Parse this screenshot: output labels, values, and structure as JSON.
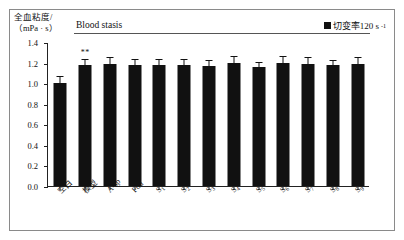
{
  "figure": {
    "y_axis_title_line1": "全血粘度/",
    "y_axis_title_line2": "（mPa · s）",
    "group_header": "Blood stasis",
    "legend": {
      "label_main": "切变率120 s",
      "label_sup": "-1",
      "swatch_color": "#111111"
    },
    "significance_marker": "**"
  },
  "chart_data": {
    "type": "bar",
    "title": "",
    "subtitle": "Blood stasis",
    "xlabel": "",
    "ylabel": "全血粘度/（mPa · s）",
    "ylim": [
      0.0,
      1.4
    ],
    "ytick_labels": [
      "0.0",
      "0.2",
      "0.4",
      "0.6",
      "0.8",
      "1.0",
      "1.2",
      "1.4"
    ],
    "ytick_values": [
      0.0,
      0.2,
      0.4,
      0.6,
      0.8,
      1.0,
      1.2,
      1.4
    ],
    "grid": false,
    "legend_position": "top-right",
    "legend_entries": [
      "切变率120 s-1"
    ],
    "bar_color": "#111111",
    "categories": [
      "空白",
      "模型",
      "A-sp",
      "Fdd",
      "S₁",
      "S₂",
      "S₃",
      "S₄",
      "S₅",
      "S₆",
      "S₇",
      "S₈",
      "S₉"
    ],
    "category_labels_main": [
      "空白",
      "模型",
      "A-sp",
      "Fdd",
      "S",
      "S",
      "S",
      "S",
      "S",
      "S",
      "S",
      "S",
      "S"
    ],
    "category_labels_sub": [
      "",
      "",
      "",
      "",
      "1",
      "2",
      "3",
      "4",
      "5",
      "6",
      "7",
      "8",
      "9"
    ],
    "values": [
      1.0,
      1.18,
      1.19,
      1.18,
      1.18,
      1.18,
      1.17,
      1.2,
      1.16,
      1.2,
      1.19,
      1.18,
      1.19
    ],
    "errors": [
      0.06,
      0.05,
      0.05,
      0.05,
      0.05,
      0.05,
      0.05,
      0.05,
      0.04,
      0.05,
      0.05,
      0.04,
      0.05
    ],
    "annotations": [
      {
        "category": "模型",
        "text": "**",
        "value": 1.18
      }
    ],
    "series": [
      {
        "name": "切变率120 s-1",
        "values": [
          1.0,
          1.18,
          1.19,
          1.18,
          1.18,
          1.18,
          1.17,
          1.2,
          1.16,
          1.2,
          1.19,
          1.18,
          1.19
        ]
      }
    ]
  }
}
